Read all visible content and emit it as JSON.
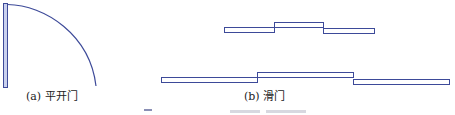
{
  "figure": {
    "stroke_color": "#3d4a99",
    "fill_color": "#ffffff",
    "door_leaf_fill": "#c9d0ee",
    "panels": [
      {
        "id": "a",
        "caption": "(a) 平开门",
        "type": "swing-door"
      },
      {
        "id": "b",
        "caption": "(b) 滑门",
        "type": "sliding-door"
      }
    ]
  }
}
